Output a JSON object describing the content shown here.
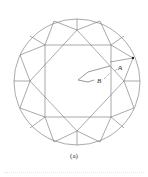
{
  "figure": {
    "caption": "(a)",
    "labels": {
      "a": "A",
      "b": "B"
    },
    "colors": {
      "line": "#6e6e6e",
      "background": "#ffffff"
    }
  }
}
